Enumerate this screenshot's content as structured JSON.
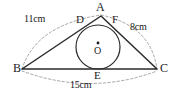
{
  "figure": {
    "type": "geometry-diagram",
    "stroke_color": "#2b2b2b",
    "dashed_color": "#9a9a9a",
    "background_color": "#ffffff",
    "vertices": [
      {
        "name": "A",
        "label": "A",
        "x": 101,
        "y": 16
      },
      {
        "name": "B",
        "label": "B",
        "x": 22,
        "y": 69
      },
      {
        "name": "C",
        "label": "C",
        "x": 157,
        "y": 69
      }
    ],
    "tangent_points": [
      {
        "name": "D",
        "label": "D",
        "x": 84,
        "y": 26,
        "on_side": "AB"
      },
      {
        "name": "E",
        "label": "E",
        "x": 98,
        "y": 69,
        "on_side": "BC"
      },
      {
        "name": "F",
        "label": "F",
        "x": 115,
        "y": 26,
        "on_side": "AC"
      }
    ],
    "circle": {
      "center_label": "O",
      "center_x": 98,
      "center_y": 47,
      "radius": 22
    },
    "measures": [
      {
        "name": "side-ab",
        "label": "11cm",
        "side": "AB",
        "x": 28,
        "y": 20
      },
      {
        "name": "side-ac",
        "label": "8cm",
        "side": "AC",
        "x": 130,
        "y": 25
      },
      {
        "name": "side-bc",
        "label": "15cm",
        "side": "BC",
        "x": 74,
        "y": 84
      }
    ]
  }
}
